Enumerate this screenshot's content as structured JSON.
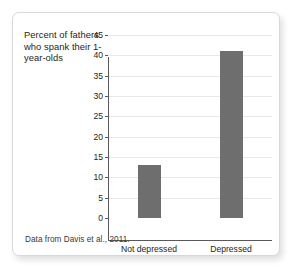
{
  "figure": {
    "title_text": "Percent of fathers who spank their 1-year-olds",
    "source_note": "Data from Davis et al., 2011.",
    "bar_color": "#6e6e6e",
    "axis_color": "#58595b",
    "gridline_color": "#e9e9e9",
    "frame_border_color": "#d8d8d8",
    "background_color": "#ffffff"
  },
  "chart_data": {
    "type": "bar",
    "title": "Percent of fathers who spank their 1-year-olds",
    "xlabel": "",
    "ylabel": "",
    "categories": [
      "Not depressed",
      "Depressed"
    ],
    "values": [
      13,
      41
    ],
    "ylim": [
      0,
      45
    ],
    "ytick_labels": [
      "0",
      "5",
      "10",
      "15",
      "20",
      "25",
      "30",
      "35",
      "40",
      "45"
    ],
    "ytick_values": [
      0,
      5,
      10,
      15,
      20,
      25,
      30,
      35,
      40,
      45
    ],
    "grid": true,
    "grid_axis": "y",
    "legend": false,
    "series": [
      {
        "name": "Percent of fathers who spank their 1-year-olds",
        "values": [
          13,
          41
        ],
        "color": "#6e6e6e"
      }
    ],
    "annotations": [
      "Data from Davis et al., 2011."
    ]
  }
}
